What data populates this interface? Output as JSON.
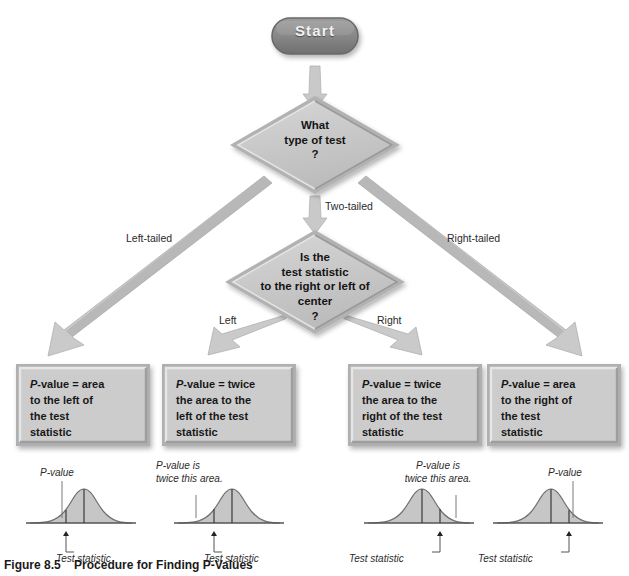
{
  "figure": {
    "caption_label": "Figure 8.5",
    "caption_text": "Procedure for Finding P-Values",
    "background": "#ffffff",
    "node_fill": "#c9c9c9",
    "node_edge": "#8f8f8f",
    "arrow_fill": "#c4c4c4",
    "start_fill": "#8a8a8a",
    "curve_fill": "#bdbdbd"
  },
  "nodes": {
    "start": {
      "label": "Start",
      "shape": "rounded-pill"
    },
    "decision_1": {
      "shape": "diamond",
      "lines": [
        "What",
        "type of test",
        "?"
      ]
    },
    "decision_2": {
      "shape": "diamond",
      "lines": [
        "Is the",
        "test statistic",
        "to the right or left of",
        "center",
        "?"
      ]
    }
  },
  "edges": [
    {
      "name": "left-tailed",
      "label": "Left-tailed",
      "from": "decision_1",
      "to": "result_1"
    },
    {
      "name": "two-tailed",
      "label": "Two-tailed",
      "from": "decision_1",
      "to": "decision_2"
    },
    {
      "name": "right-tailed",
      "label": "Right-tailed",
      "from": "decision_1",
      "to": "result_4"
    },
    {
      "name": "left",
      "label": "Left",
      "from": "decision_2",
      "to": "result_2"
    },
    {
      "name": "right",
      "label": "Right",
      "from": "decision_2",
      "to": "result_3"
    }
  ],
  "results": [
    {
      "name": "result-left-tailed",
      "prefix": "P",
      "lines": [
        "-value = area",
        "to the left of",
        "the test",
        "statistic"
      ]
    },
    {
      "name": "result-two-tailed-left",
      "prefix": "P",
      "lines": [
        "-value = twice",
        "the area to the",
        "left of the test",
        "statistic"
      ]
    },
    {
      "name": "result-two-tailed-right",
      "prefix": "P",
      "lines": [
        "-value = twice",
        "the area to the",
        "right of the test",
        "statistic"
      ]
    },
    {
      "name": "result-right-tailed",
      "prefix": "P",
      "lines": [
        "-value = area",
        "to the right of",
        "the test",
        "statistic"
      ]
    }
  ],
  "curves": [
    {
      "name": "curve-left-tailed",
      "pvalue_note": [
        "P-value"
      ],
      "statistic_note": "Test statistic",
      "shaded_side": "left",
      "statistic_position": "left-of-center"
    },
    {
      "name": "curve-two-tailed-left",
      "pvalue_note": [
        "P-value is",
        "twice this area."
      ],
      "statistic_note": "Test statistic",
      "shaded_side": "left",
      "statistic_position": "left-of-center"
    },
    {
      "name": "curve-two-tailed-right",
      "pvalue_note": [
        "P-value is",
        "twice this area."
      ],
      "statistic_note": "Test statistic",
      "shaded_side": "right",
      "statistic_position": "right-of-center"
    },
    {
      "name": "curve-right-tailed",
      "pvalue_note": [
        "P-value"
      ],
      "statistic_note": "Test statistic",
      "shaded_side": "right",
      "statistic_position": "right-of-center"
    }
  ]
}
